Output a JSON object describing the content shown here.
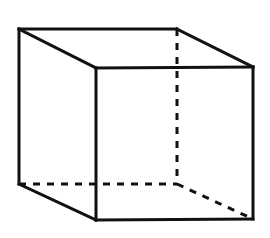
{
  "diagram": {
    "type": "wireframe-cube",
    "projection": "oblique",
    "colors": {
      "line": "#111111",
      "background": "#ffffff"
    },
    "vertices": {
      "back_top_left": [
        19,
        29
      ],
      "back_top_right": [
        177,
        29
      ],
      "back_bottom_left": [
        19,
        184
      ],
      "back_bottom_right": [
        177,
        184
      ],
      "front_top_left": [
        96,
        68
      ],
      "front_top_right": [
        253,
        67
      ],
      "front_bottom_left": [
        96,
        220
      ],
      "front_bottom_right": [
        253,
        219
      ]
    },
    "visible_edges": [
      [
        "back_top_left",
        "back_top_right"
      ],
      [
        "back_top_left",
        "front_top_left"
      ],
      [
        "back_top_right",
        "front_top_right"
      ],
      [
        "front_top_left",
        "front_top_right"
      ],
      [
        "back_top_left",
        "back_bottom_left"
      ],
      [
        "front_top_left",
        "front_bottom_left"
      ],
      [
        "front_top_right",
        "front_bottom_right"
      ],
      [
        "back_bottom_left",
        "front_bottom_left"
      ],
      [
        "front_bottom_left",
        "front_bottom_right"
      ]
    ],
    "hidden_edges": [
      [
        "back_top_right",
        "back_bottom_right"
      ],
      [
        "back_bottom_left",
        "back_bottom_right"
      ],
      [
        "back_bottom_right",
        "front_bottom_right"
      ]
    ]
  }
}
